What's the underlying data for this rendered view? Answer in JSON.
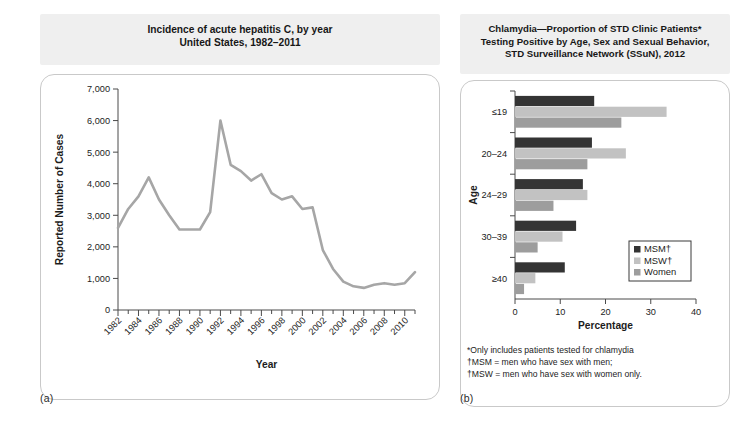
{
  "figure": {
    "panel_a": {
      "label": "(a)",
      "title_line1": "Incidence of acute hepatitis C, by year",
      "title_line2": "United States, 1982–2011"
    },
    "panel_b": {
      "label": "(b)",
      "title_line1": "Chlamydia—Proportion of STD Clinic Patients*",
      "title_line2": "Testing Positive by Age, Sex and Sexual Behavior,",
      "title_line3": "STD Surveillance Network (SSuN), 2012",
      "footnotes": [
        "*Only includes patients tested for chlamydia",
        "†MSM = men who have sex with men;",
        "†MSW = men who have sex with women only."
      ]
    }
  },
  "chart_data": [
    {
      "panel": "(a)",
      "type": "line",
      "title": "Incidence of acute hepatitis C, by year United States, 1982–2011",
      "xlabel": "Year",
      "ylabel": "Reported Number of Cases",
      "xlim": [
        1982,
        2011
      ],
      "ylim": [
        0,
        7000
      ],
      "ytick_labels": [
        "0",
        "1,000",
        "2,000",
        "3,000",
        "4,000",
        "5,000",
        "6,000",
        "7,000"
      ],
      "ytick_values": [
        0,
        1000,
        2000,
        3000,
        4000,
        5000,
        6000,
        7000
      ],
      "xtick_labels": [
        "1982",
        "1984",
        "1986",
        "1988",
        "1990",
        "1992",
        "1994",
        "1996",
        "1998",
        "2000",
        "2002",
        "2004",
        "2006",
        "2008",
        "2010"
      ],
      "xtick_values": [
        1982,
        1984,
        1986,
        1988,
        1990,
        1992,
        1994,
        1996,
        1998,
        2000,
        2002,
        2004,
        2006,
        2008,
        2010
      ],
      "minor_tick_interval": 1,
      "grid": false,
      "legend": null,
      "line_color": "#a6a6a6",
      "x": [
        1982,
        1983,
        1984,
        1985,
        1986,
        1987,
        1988,
        1989,
        1990,
        1991,
        1992,
        1993,
        1994,
        1995,
        1996,
        1997,
        1998,
        1999,
        2000,
        2001,
        2002,
        2003,
        2004,
        2005,
        2006,
        2007,
        2008,
        2009,
        2010,
        2011
      ],
      "values": [
        2600,
        3200,
        3600,
        4200,
        3500,
        3000,
        2550,
        2550,
        2550,
        3100,
        6000,
        4600,
        4400,
        4100,
        4300,
        3700,
        3500,
        3600,
        3200,
        3250,
        1900,
        1300,
        900,
        750,
        700,
        800,
        850,
        800,
        850,
        1200
      ]
    },
    {
      "panel": "(b)",
      "type": "bar",
      "orientation": "horizontal",
      "title": "Chlamydia—Proportion of STD Clinic Patients* Testing Positive by Age, Sex and Sexual Behavior, STD Surveillance Network (SSuN), 2012",
      "xlabel": "Percentage",
      "ylabel": "Age",
      "xlim": [
        0,
        40
      ],
      "xtick_labels": [
        "0",
        "10",
        "20",
        "30",
        "40"
      ],
      "xtick_values": [
        0,
        10,
        20,
        30,
        40
      ],
      "categories": [
        "≤19",
        "20–24",
        "24–29",
        "30–39",
        "≥40"
      ],
      "grid": false,
      "legend_position": "lower-right",
      "series": [
        {
          "name": "MSM†",
          "color": "#343434",
          "values": [
            17.5,
            17.0,
            15.0,
            13.5,
            11.0
          ]
        },
        {
          "name": "MSW†",
          "color": "#c2c2c2",
          "values": [
            33.5,
            24.5,
            16.0,
            10.5,
            4.5
          ]
        },
        {
          "name": "Women",
          "color": "#9d9d9d",
          "values": [
            23.5,
            16.0,
            8.5,
            5.0,
            2.0
          ]
        }
      ]
    }
  ]
}
